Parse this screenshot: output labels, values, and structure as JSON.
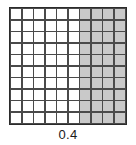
{
  "figure": {
    "caption": "0.4",
    "grid_colors": {
      "shaded_fill": "#c9c9c9",
      "unshaded_fill": "#ffffff",
      "gridline": "#4a4a4a",
      "border": "#2b2b2b"
    }
  },
  "chart_data": {
    "type": "heatmap",
    "title": "",
    "subtitle": "",
    "xlabel": "",
    "ylabel": "",
    "annotations": [
      "0.4"
    ],
    "rows": 10,
    "columns": 10,
    "total_cells": 100,
    "shaded_cells": 40,
    "fraction_shaded": 0.4,
    "shaded_columns": [
      7,
      8,
      9,
      10
    ],
    "legend": [],
    "grid": true,
    "values": [
      [
        0,
        0,
        0,
        0,
        0,
        0,
        1,
        1,
        1,
        1
      ],
      [
        0,
        0,
        0,
        0,
        0,
        0,
        1,
        1,
        1,
        1
      ],
      [
        0,
        0,
        0,
        0,
        0,
        0,
        1,
        1,
        1,
        1
      ],
      [
        0,
        0,
        0,
        0,
        0,
        0,
        1,
        1,
        1,
        1
      ],
      [
        0,
        0,
        0,
        0,
        0,
        0,
        1,
        1,
        1,
        1
      ],
      [
        0,
        0,
        0,
        0,
        0,
        0,
        1,
        1,
        1,
        1
      ],
      [
        0,
        0,
        0,
        0,
        0,
        0,
        1,
        1,
        1,
        1
      ],
      [
        0,
        0,
        0,
        0,
        0,
        0,
        1,
        1,
        1,
        1
      ],
      [
        0,
        0,
        0,
        0,
        0,
        0,
        1,
        1,
        1,
        1
      ],
      [
        0,
        0,
        0,
        0,
        0,
        0,
        1,
        1,
        1,
        1
      ]
    ]
  }
}
